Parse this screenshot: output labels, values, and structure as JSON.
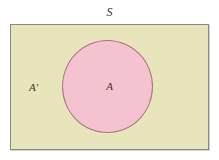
{
  "figure": {
    "type": "venn-diagram",
    "universal_set": {
      "label": "S",
      "fill_color": "#e8e4bc",
      "border_color": "#8a8a80",
      "shape": "rectangle"
    },
    "set_a": {
      "label": "A",
      "fill_color": "#f5c3cf",
      "border_color": "#a8737f",
      "shape": "circle"
    },
    "complement": {
      "label": "A'",
      "region": "inside rectangle, outside circle"
    },
    "background_color": "#ffffff"
  }
}
